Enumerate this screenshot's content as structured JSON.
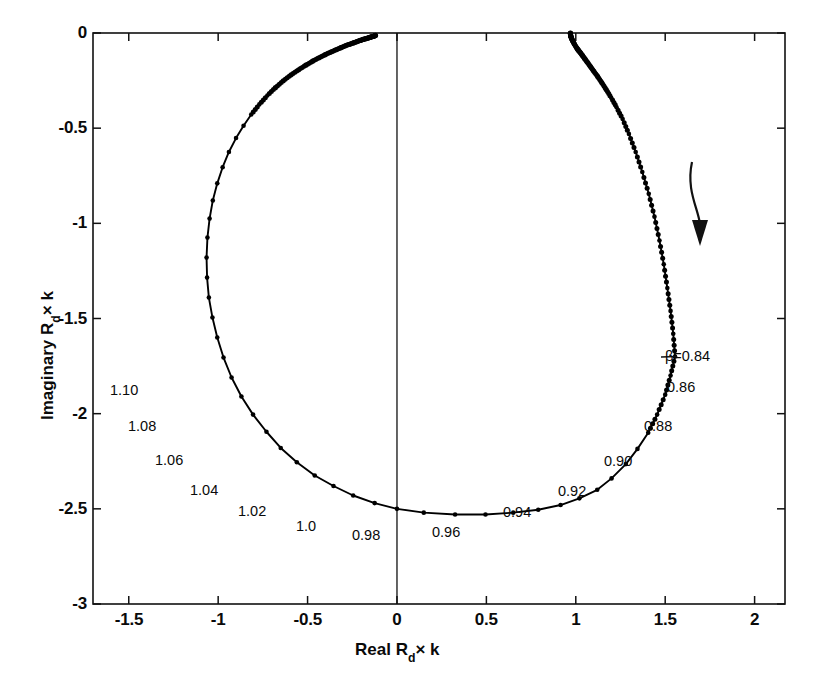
{
  "chart_data": {
    "type": "scatter",
    "title": "",
    "xlabel": "Real R_d × k",
    "ylabel": "Imaginary R_d × k",
    "xlabel_parts": {
      "prefix": "Real R",
      "sub": "d",
      "suffix": "× k"
    },
    "ylabel_parts": {
      "prefix": "Imaginary R",
      "sub": "d",
      "suffix": "× k"
    },
    "xlim": [
      -1.7,
      2.17
    ],
    "ylim": [
      -3,
      0
    ],
    "xticks": [
      -1.5,
      -1,
      -0.5,
      0,
      0.5,
      1,
      1.5,
      2
    ],
    "xticklabels": [
      "-1.5",
      "-1",
      "-0.5",
      "0",
      "0.5",
      "1",
      "1.5",
      "2"
    ],
    "yticks": [
      0,
      -0.5,
      -1,
      -1.5,
      -2,
      -2.5,
      -3
    ],
    "yticklabels": [
      "0",
      "-0.5",
      "-1",
      "-1.5",
      "-2",
      "-2.5",
      "-3"
    ],
    "grid": false,
    "legend": null,
    "parameter_symbol": "β",
    "series": [
      {
        "name": "Rd x k locus",
        "marker": "dot",
        "line": "solid",
        "color": "#000000",
        "points": [
          {
            "beta": 0.84,
            "x": 1.555,
            "y": -1.7
          },
          {
            "beta": 0.85,
            "x": 1.53,
            "y": -1.8
          },
          {
            "beta": 0.86,
            "x": 1.5,
            "y": -1.9
          },
          {
            "beta": 0.87,
            "x": 1.455,
            "y": -2.005
          },
          {
            "beta": 0.88,
            "x": 1.405,
            "y": -2.1
          },
          {
            "beta": 0.89,
            "x": 1.345,
            "y": -2.185
          },
          {
            "beta": 0.9,
            "x": 1.28,
            "y": -2.265
          },
          {
            "beta": 0.91,
            "x": 1.2,
            "y": -2.34
          },
          {
            "beta": 0.92,
            "x": 1.12,
            "y": -2.4
          },
          {
            "beta": 0.93,
            "x": 1.02,
            "y": -2.445
          },
          {
            "beta": 0.94,
            "x": 0.915,
            "y": -2.48
          },
          {
            "beta": 0.95,
            "x": 0.79,
            "y": -2.505
          },
          {
            "beta": 0.96,
            "x": 0.65,
            "y": -2.52
          },
          {
            "beta": 0.97,
            "x": 0.495,
            "y": -2.53
          },
          {
            "beta": 0.98,
            "x": 0.325,
            "y": -2.53
          },
          {
            "beta": 0.99,
            "x": 0.15,
            "y": -2.52
          },
          {
            "beta": 1.0,
            "x": 0.0,
            "y": -2.5
          },
          {
            "beta": 1.01,
            "x": -0.125,
            "y": -2.47
          },
          {
            "beta": 1.02,
            "x": -0.245,
            "y": -2.43
          },
          {
            "beta": 1.03,
            "x": -0.355,
            "y": -2.38
          },
          {
            "beta": 1.04,
            "x": -0.46,
            "y": -2.325
          },
          {
            "beta": 1.05,
            "x": -0.56,
            "y": -2.255
          },
          {
            "beta": 1.06,
            "x": -0.65,
            "y": -2.18
          },
          {
            "beta": 1.07,
            "x": -0.73,
            "y": -2.095
          },
          {
            "beta": 1.08,
            "x": -0.805,
            "y": -2.005
          },
          {
            "beta": 1.09,
            "x": -0.87,
            "y": -1.91
          },
          {
            "beta": 1.1,
            "x": -0.925,
            "y": -1.81
          },
          {
            "beta": 1.11,
            "x": -0.97,
            "y": -1.705
          },
          {
            "beta": 1.12,
            "x": -1.005,
            "y": -1.6
          },
          {
            "beta": 1.13,
            "x": -1.032,
            "y": -1.495
          },
          {
            "beta": 1.14,
            "x": -1.052,
            "y": -1.39
          },
          {
            "beta": 1.15,
            "x": -1.062,
            "y": -1.285
          },
          {
            "beta": 1.16,
            "x": -1.065,
            "y": -1.18
          },
          {
            "beta": 1.17,
            "x": -1.06,
            "y": -1.075
          },
          {
            "beta": 1.18,
            "x": -1.048,
            "y": -0.975
          },
          {
            "beta": 1.19,
            "x": -1.03,
            "y": -0.88
          },
          {
            "beta": 1.2,
            "x": -1.005,
            "y": -0.79
          },
          {
            "beta": 1.21,
            "x": -0.975,
            "y": -0.705
          },
          {
            "beta": 1.22,
            "x": -0.94,
            "y": -0.625
          },
          {
            "beta": 1.23,
            "x": -0.9,
            "y": -0.552
          },
          {
            "beta": 1.24,
            "x": -0.858,
            "y": -0.487
          },
          {
            "beta": 1.25,
            "x": -0.815,
            "y": -0.428
          },
          {
            "beta": 1.26,
            "x": -0.77,
            "y": -0.375
          },
          {
            "beta": 1.27,
            "x": -0.725,
            "y": -0.328
          },
          {
            "beta": 1.28,
            "x": -0.68,
            "y": -0.287
          },
          {
            "beta": 1.29,
            "x": -0.636,
            "y": -0.251
          },
          {
            "beta": 1.3,
            "x": -0.592,
            "y": -0.22
          },
          {
            "beta": 1.31,
            "x": -0.55,
            "y": -0.193
          },
          {
            "beta": 1.32,
            "x": -0.51,
            "y": -0.169
          },
          {
            "beta": 1.33,
            "x": -0.472,
            "y": -0.148
          },
          {
            "beta": 1.34,
            "x": -0.436,
            "y": -0.13
          },
          {
            "beta": 1.35,
            "x": -0.402,
            "y": -0.114
          },
          {
            "beta": 1.36,
            "x": -0.37,
            "y": -0.1
          },
          {
            "beta": 1.37,
            "x": -0.341,
            "y": -0.088
          },
          {
            "beta": 1.38,
            "x": -0.314,
            "y": -0.077
          },
          {
            "beta": 1.39,
            "x": -0.289,
            "y": -0.067
          },
          {
            "beta": 1.4,
            "x": -0.265,
            "y": -0.059
          },
          {
            "beta": 1.41,
            "x": -0.244,
            "y": -0.052
          },
          {
            "beta": 1.42,
            "x": -0.224,
            "y": -0.045
          },
          {
            "beta": 1.43,
            "x": -0.206,
            "y": -0.039
          },
          {
            "beta": 1.44,
            "x": -0.19,
            "y": -0.034
          },
          {
            "beta": 1.45,
            "x": -0.175,
            "y": -0.03
          },
          {
            "beta": 1.46,
            "x": -0.161,
            "y": -0.026
          },
          {
            "beta": 1.47,
            "x": -0.149,
            "y": -0.022
          },
          {
            "beta": 1.48,
            "x": -0.138,
            "y": -0.019
          },
          {
            "beta": 1.49,
            "x": -0.128,
            "y": -0.016
          },
          {
            "beta": 1.5,
            "x": -0.12,
            "y": -0.013
          }
        ],
        "upper_right_branch": [
          {
            "beta": 0.83,
            "x": 1.545,
            "y": -1.58
          },
          {
            "beta": 0.82,
            "x": 1.53,
            "y": -1.46
          },
          {
            "beta": 0.81,
            "x": 1.512,
            "y": -1.34
          },
          {
            "beta": 0.8,
            "x": 1.492,
            "y": -1.215
          },
          {
            "beta": 0.79,
            "x": 1.468,
            "y": -1.09
          },
          {
            "beta": 0.78,
            "x": 1.44,
            "y": -0.965
          },
          {
            "beta": 0.77,
            "x": 1.408,
            "y": -0.845
          },
          {
            "beta": 0.76,
            "x": 1.372,
            "y": -0.73
          },
          {
            "beta": 0.75,
            "x": 1.335,
            "y": -0.625
          },
          {
            "beta": 0.74,
            "x": 1.297,
            "y": -0.53
          },
          {
            "beta": 0.73,
            "x": 1.262,
            "y": -0.452
          },
          {
            "beta": 0.72,
            "x": 1.228,
            "y": -0.39
          },
          {
            "beta": 0.71,
            "x": 1.198,
            "y": -0.34
          },
          {
            "beta": 0.7,
            "x": 1.17,
            "y": -0.297
          },
          {
            "beta": 0.69,
            "x": 1.145,
            "y": -0.26
          },
          {
            "beta": 0.68,
            "x": 1.122,
            "y": -0.228
          },
          {
            "beta": 0.67,
            "x": 1.1,
            "y": -0.2
          },
          {
            "beta": 0.66,
            "x": 1.082,
            "y": -0.176
          },
          {
            "beta": 0.65,
            "x": 1.065,
            "y": -0.154
          },
          {
            "beta": 0.64,
            "x": 1.05,
            "y": -0.135
          },
          {
            "beta": 0.63,
            "x": 1.037,
            "y": -0.118
          },
          {
            "beta": 0.62,
            "x": 1.025,
            "y": -0.103
          },
          {
            "beta": 0.61,
            "x": 1.014,
            "y": -0.09
          },
          {
            "beta": 0.6,
            "x": 1.005,
            "y": -0.078
          },
          {
            "beta": 0.58,
            "x": 0.992,
            "y": -0.058
          },
          {
            "beta": 0.56,
            "x": 0.983,
            "y": -0.042
          },
          {
            "beta": 0.54,
            "x": 0.977,
            "y": -0.03
          },
          {
            "beta": 0.52,
            "x": 0.973,
            "y": -0.02
          },
          {
            "beta": 0.5,
            "x": 0.971,
            "y": -0.012
          },
          {
            "beta": 0.46,
            "x": 0.97,
            "y": -0.004
          },
          {
            "beta": 0.42,
            "x": 0.97,
            "y": -0.001
          }
        ]
      }
    ],
    "annotations": [
      {
        "id": "beta-084",
        "text": "β=0.84",
        "value": 0.84,
        "has_leader": true,
        "point": {
          "x": 1.555,
          "y": -1.7
        },
        "label_px": {
          "left": 665,
          "top": 348
        }
      },
      {
        "id": "beta-086",
        "text": "0.86",
        "value": 0.86,
        "has_leader": false,
        "point": {
          "x": 1.5,
          "y": -1.9
        },
        "label_px": {
          "left": 667,
          "top": 379
        }
      },
      {
        "id": "beta-088",
        "text": "0.88",
        "value": 0.88,
        "has_leader": false,
        "point": {
          "x": 1.405,
          "y": -2.1
        },
        "label_px": {
          "left": 644,
          "top": 418
        }
      },
      {
        "id": "beta-090",
        "text": "0.90",
        "value": 0.9,
        "has_leader": false,
        "point": {
          "x": 1.28,
          "y": -2.265
        },
        "label_px": {
          "left": 604,
          "top": 453
        }
      },
      {
        "id": "beta-092",
        "text": "0.92",
        "value": 0.92,
        "has_leader": false,
        "point": {
          "x": 1.12,
          "y": -2.4
        },
        "label_px": {
          "left": 558,
          "top": 483
        }
      },
      {
        "id": "beta-094",
        "text": "0.94",
        "value": 0.94,
        "has_leader": false,
        "point": {
          "x": 0.915,
          "y": -2.48
        },
        "label_px": {
          "left": 503,
          "top": 504
        }
      },
      {
        "id": "beta-096",
        "text": "0.96",
        "value": 0.96,
        "has_leader": false,
        "point": {
          "x": 0.65,
          "y": -2.52
        },
        "label_px": {
          "left": 432,
          "top": 524
        }
      },
      {
        "id": "beta-098",
        "text": "0.98",
        "value": 0.98,
        "has_leader": false,
        "point": {
          "x": 0.325,
          "y": -2.53
        },
        "label_px": {
          "left": 352,
          "top": 527
        }
      },
      {
        "id": "beta-100",
        "text": "1.0",
        "value": 1.0,
        "has_leader": false,
        "point": {
          "x": 0.0,
          "y": -2.5
        },
        "label_px": {
          "left": 296,
          "top": 518
        }
      },
      {
        "id": "beta-102",
        "text": "1.02",
        "value": 1.02,
        "has_leader": false,
        "point": {
          "x": -0.245,
          "y": -2.43
        },
        "label_px": {
          "left": 238,
          "top": 503
        }
      },
      {
        "id": "beta-104",
        "text": "1.04",
        "value": 1.04,
        "has_leader": false,
        "point": {
          "x": -0.46,
          "y": -2.325
        },
        "label_px": {
          "left": 190,
          "top": 482
        }
      },
      {
        "id": "beta-106",
        "text": "1.06",
        "value": 1.06,
        "has_leader": false,
        "point": {
          "x": -0.65,
          "y": -2.18
        },
        "label_px": {
          "left": 155,
          "top": 452
        }
      },
      {
        "id": "beta-108",
        "text": "1.08",
        "value": 1.08,
        "has_leader": false,
        "point": {
          "x": -0.805,
          "y": -2.005
        },
        "label_px": {
          "left": 128,
          "top": 418
        }
      },
      {
        "id": "beta-110",
        "text": "1.10",
        "value": 1.1,
        "has_leader": false,
        "point": {
          "x": -0.925,
          "y": -1.81
        },
        "label_px": {
          "left": 110,
          "top": 382
        }
      }
    ],
    "direction_arrow": {
      "name": "direction-arrow",
      "description": "curved arrow indicating increasing beta direction along locus",
      "start_px": {
        "x": 692,
        "y": 162
      },
      "end_px": {
        "x": 700,
        "y": 240
      }
    }
  },
  "axes_pixels": {
    "left": 93,
    "right": 785,
    "top": 33,
    "bottom": 604
  }
}
